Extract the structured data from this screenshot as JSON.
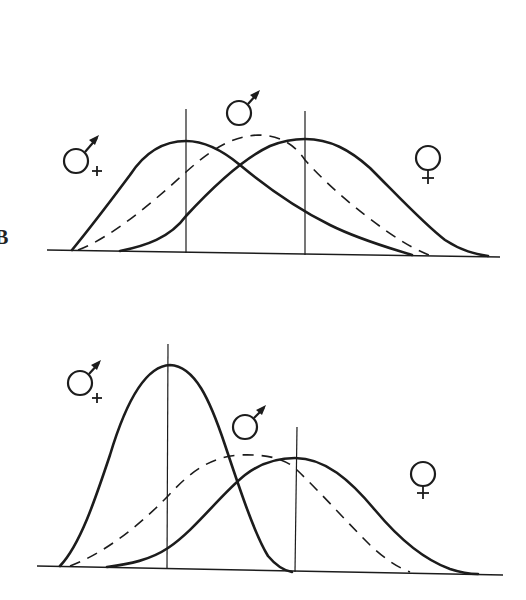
{
  "figure": {
    "panel_label": "B",
    "colors": {
      "ink": "#1c1c1c",
      "background": "#ffffff"
    }
  },
  "legend_symbols": {
    "male_plus": {
      "glyph": "♂+",
      "meaning": "male-plus symbol (mars with plus sign)"
    },
    "male": {
      "glyph": "♂",
      "meaning": "male symbol (mars)"
    },
    "female": {
      "glyph": "♀",
      "meaning": "female symbol (venus)"
    }
  },
  "panels": [
    {
      "id": "top",
      "label": "B",
      "curves": [
        {
          "name": "male-plus",
          "style": "solid",
          "symbol": "♂+",
          "peak_position": "left",
          "shape": "skewed right, moderate height"
        },
        {
          "name": "male",
          "style": "dashed",
          "symbol": "♂",
          "peak_position": "middle",
          "shape": "broad, intermediate"
        },
        {
          "name": "female",
          "style": "solid",
          "symbol": "♀",
          "peak_position": "right",
          "shape": "skewed left, moderate height"
        }
      ],
      "vertical_markers": 2
    },
    {
      "id": "bottom",
      "label": "",
      "curves": [
        {
          "name": "male-plus",
          "style": "solid",
          "symbol": "♂+",
          "peak_position": "left",
          "shape": "tall, narrow"
        },
        {
          "name": "male",
          "style": "dashed",
          "symbol": "♂",
          "peak_position": "middle",
          "shape": "broad, flat"
        },
        {
          "name": "female",
          "style": "solid",
          "symbol": "♀",
          "peak_position": "right",
          "shape": "broad, low"
        }
      ],
      "vertical_markers": 2
    }
  ]
}
